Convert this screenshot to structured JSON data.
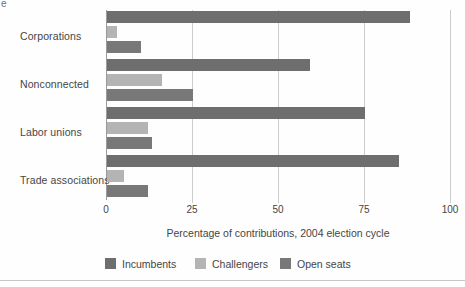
{
  "fragment": "e",
  "colors": {
    "incumbents": "#6e6e6e",
    "challengers": "#b4b4b4",
    "open_seats": "#787878",
    "gridline": "#cccccc",
    "axis": "#9a9a9a",
    "text": "#454545",
    "bottom_rule": "#c6c6c6",
    "background": "#fefefe"
  },
  "chart_data": {
    "type": "bar",
    "orientation": "horizontal",
    "title": "",
    "categories": [
      "Corporations",
      "Nonconnected",
      "Labor unions",
      "Trade associations"
    ],
    "series": [
      {
        "name": "Incumbents",
        "color_key": "incumbents",
        "values": [
          88,
          59,
          75,
          85
        ]
      },
      {
        "name": "Challengers",
        "color_key": "challengers",
        "values": [
          3,
          16,
          12,
          5
        ]
      },
      {
        "name": "Open seats",
        "color_key": "open_seats",
        "values": [
          10,
          25,
          13,
          12
        ]
      }
    ],
    "xlabel": "Percentage of contributions, 2004 election cycle",
    "ylabel": "",
    "xlim": [
      0,
      100
    ],
    "xticks": [
      "0",
      "25",
      "50",
      "75",
      "100"
    ],
    "xtick_values": [
      0,
      25,
      50,
      75,
      100
    ],
    "grid": true,
    "legend_position": "bottom"
  }
}
